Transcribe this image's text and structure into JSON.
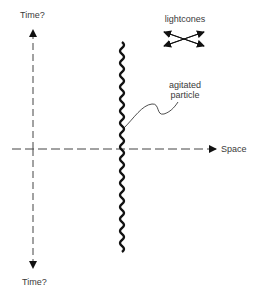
{
  "diagram": {
    "axes": {
      "time_up_label": "Time?",
      "time_down_label": "Time?",
      "space_label": "Space"
    },
    "legend": {
      "lightcones_label": "lightcones"
    },
    "annotations": {
      "particle_label_line1": "agitated",
      "particle_label_line2": "particle"
    },
    "colors": {
      "ink": "#111111",
      "axis": "#333333",
      "text": "#3a3a3a",
      "background": "#ffffff"
    }
  }
}
